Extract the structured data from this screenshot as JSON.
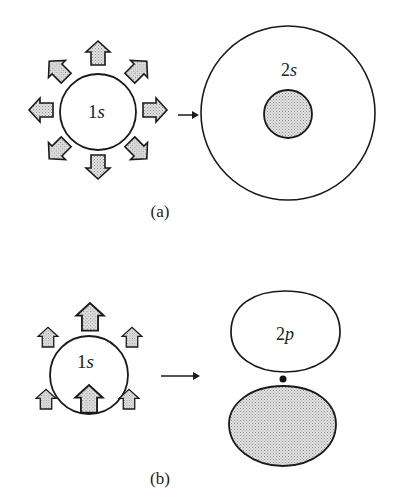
{
  "panel_a": {
    "caption": "(a)",
    "inner_orbital": {
      "label_num": "1",
      "label_sym": "s"
    },
    "outer_orbital": {
      "label_num": "2",
      "label_sym": "s"
    },
    "arrow_count": 8,
    "arrow_direction": "radially outward"
  },
  "panel_b": {
    "caption": "(b)",
    "inner_orbital": {
      "label_num": "1",
      "label_sym": "s"
    },
    "outer_orbital": {
      "label_num": "2",
      "label_sym": "p"
    },
    "arrow_count": 6,
    "arrow_direction": "upward"
  },
  "colors": {
    "stroke": "#1a1a1a",
    "shade": "#c9c9c9",
    "background": "#ffffff"
  }
}
